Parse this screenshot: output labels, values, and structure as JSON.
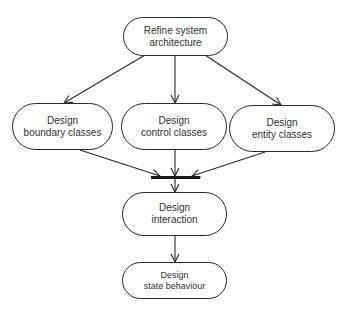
{
  "diagram": {
    "type": "activity-diagram",
    "nodes": [
      {
        "id": "refine",
        "line1": "Refine system",
        "line2": "architecture"
      },
      {
        "id": "boundary",
        "line1": "Design",
        "line2": "boundary classes"
      },
      {
        "id": "control",
        "line1": "Design",
        "line2": "control classes"
      },
      {
        "id": "entity",
        "line1": "Design",
        "line2": "entity classes"
      },
      {
        "id": "interaction",
        "line1": "Design",
        "line2": "interaction"
      },
      {
        "id": "state",
        "line1": "Design",
        "line2": "state behaviour"
      }
    ],
    "edges": [
      {
        "from": "refine",
        "to": "boundary"
      },
      {
        "from": "refine",
        "to": "control"
      },
      {
        "from": "refine",
        "to": "entity"
      },
      {
        "from": "boundary",
        "to": "join-bar"
      },
      {
        "from": "control",
        "to": "join-bar"
      },
      {
        "from": "entity",
        "to": "join-bar"
      },
      {
        "from": "join-bar",
        "to": "interaction"
      },
      {
        "from": "interaction",
        "to": "state"
      }
    ],
    "colors": {
      "stroke": "#2a2a2a",
      "text": "#333333",
      "background": "#ffffff"
    }
  }
}
